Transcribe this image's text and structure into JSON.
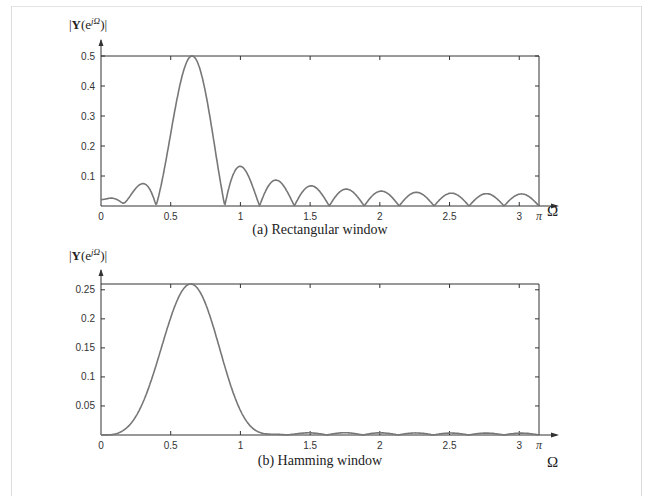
{
  "chart_data": [
    {
      "type": "line",
      "title": "(a) Rectangular window",
      "ylabel": "|Y(e^{jΩ})|",
      "xlabel": "Ω",
      "xlim": [
        0,
        3.14159
      ],
      "ylim": [
        0,
        0.5
      ],
      "x_ticks": [
        "0",
        "0.5",
        "1",
        "1.5",
        "2",
        "2.5",
        "3",
        "π"
      ],
      "y_ticks": [
        "0.1",
        "0.2",
        "0.3",
        "0.4",
        "0.5"
      ],
      "grid": false,
      "model": {
        "window": "rectangular",
        "N": 25,
        "omega0": 0.64
      },
      "series": [
        {
          "name": "|Y(e^{jΩ})|",
          "x": [
            0,
            0.13,
            0.27,
            0.38,
            0.5,
            0.64,
            0.78,
            0.89,
            1.0,
            1.14,
            1.26,
            1.39,
            1.51,
            1.64,
            1.76,
            1.89,
            2.01,
            2.14,
            2.27,
            2.39,
            2.52,
            2.64,
            2.77,
            2.89,
            3.02,
            3.14
          ],
          "values": [
            0.04,
            0.0,
            0.078,
            0.0,
            0.33,
            0.5,
            0.33,
            0.0,
            0.13,
            0.0,
            0.087,
            0.0,
            0.067,
            0.0,
            0.056,
            0.0,
            0.049,
            0.0,
            0.045,
            0.0,
            0.042,
            0.0,
            0.04,
            0.0,
            0.039,
            0.0
          ]
        }
      ]
    },
    {
      "type": "line",
      "title": "(b) Hamming  window",
      "ylabel": "|Y(e^{jΩ})|",
      "xlabel": "Ω",
      "xlim": [
        0,
        3.14159
      ],
      "ylim": [
        0,
        0.26
      ],
      "x_ticks": [
        "0",
        "0.5",
        "1",
        "1.5",
        "2",
        "2.5",
        "3",
        "π"
      ],
      "y_ticks": [
        "0.05",
        "0.1",
        "0.15",
        "0.2",
        "0.25"
      ],
      "grid": false,
      "model": {
        "window": "hamming",
        "N": 25,
        "omega0": 0.64
      },
      "series": [
        {
          "name": "|Y(e^{jΩ})|",
          "x": [
            0,
            0.1,
            0.2,
            0.3,
            0.4,
            0.5,
            0.64,
            0.8,
            0.9,
            1.0,
            1.1,
            1.2,
            1.5,
            2.0,
            2.5,
            3.0,
            3.14
          ],
          "values": [
            0.0,
            0.001,
            0.02,
            0.07,
            0.14,
            0.21,
            0.26,
            0.2,
            0.13,
            0.06,
            0.015,
            0.001,
            0.002,
            0.002,
            0.002,
            0.002,
            0.0
          ]
        }
      ]
    }
  ],
  "panels": [
    {
      "ylabel_main": "Y",
      "ylabel_pre": "|",
      "ylabel_open": "(e",
      "ylabel_sup": "jΩ",
      "ylabel_close": ")|",
      "caption": "(a) Rectangular window",
      "omega": "Ω",
      "pi": "π"
    },
    {
      "ylabel_main": "Y",
      "ylabel_pre": "|",
      "ylabel_open": "(e",
      "ylabel_sup": "jΩ",
      "ylabel_close": ")|",
      "caption": "(b) Hamming  window",
      "omega": "Ω",
      "pi": "π"
    }
  ],
  "colors": {
    "curve": "#777777",
    "axis": "#333333",
    "frame": "#dcdcdc"
  }
}
